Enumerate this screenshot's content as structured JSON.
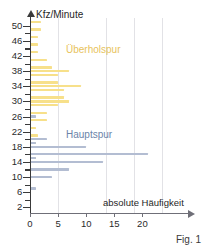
{
  "figure": {
    "caption": "Fig. 1"
  },
  "chart_data": {
    "type": "bar",
    "orientation": "horizontal",
    "title": "",
    "xlabel": "absolute Häufigkeit",
    "ylabel": "Kfz/Minute",
    "xlim": [
      0,
      22
    ],
    "ylim": [
      0,
      52
    ],
    "grid": "vertical",
    "xticks": [
      0,
      5,
      10,
      15,
      20
    ],
    "xtick_labels": [
      "0",
      "5",
      "10",
      "15",
      "20"
    ],
    "yticks": [
      2,
      6,
      10,
      14,
      18,
      22,
      26,
      30,
      34,
      38,
      42,
      46,
      50
    ],
    "ytick_labels": [
      "2",
      "6",
      "10",
      "14",
      "18",
      "22",
      "26",
      "30",
      "34",
      "38",
      "42",
      "46",
      "50"
    ],
    "y_minor_step": 2,
    "legend_position": "inside-plot",
    "colors": {
      "ueberholspur": "#f7e08a",
      "hauptspur": "#b3bdd2",
      "ueberholspur_label": "#e8c35c",
      "hauptspur_label": "#6b84a8",
      "axis": "#3a3a3a",
      "grid": "#e2e2e6"
    },
    "series": [
      {
        "name": "Überholspur",
        "color": "#f7e08a",
        "points": [
          {
            "y": 51,
            "value": 2
          },
          {
            "y": 49,
            "value": 2
          },
          {
            "y": 47,
            "value": 1.5
          },
          {
            "y": 45,
            "value": 1.5
          },
          {
            "y": 43,
            "value": 1.5
          },
          {
            "y": 41,
            "value": 3
          },
          {
            "y": 39,
            "value": 4
          },
          {
            "y": 38,
            "value": 7
          },
          {
            "y": 37,
            "value": 5
          },
          {
            "y": 35,
            "value": 5
          },
          {
            "y": 34,
            "value": 9
          },
          {
            "y": 33,
            "value": 6
          },
          {
            "y": 31,
            "value": 6
          },
          {
            "y": 30,
            "value": 7
          },
          {
            "y": 29,
            "value": 5
          },
          {
            "y": 27,
            "value": 3
          },
          {
            "y": 25,
            "value": 3
          },
          {
            "y": 23,
            "value": 1
          },
          {
            "y": 21,
            "value": 1.5
          },
          {
            "y": 19,
            "value": 1
          },
          {
            "y": 15,
            "value": 1
          }
        ]
      },
      {
        "name": "Hauptspur",
        "color": "#b3bdd2",
        "points": [
          {
            "y": 26,
            "value": 1
          },
          {
            "y": 20,
            "value": 3
          },
          {
            "y": 19,
            "value": 1
          },
          {
            "y": 18,
            "value": 10
          },
          {
            "y": 16,
            "value": 21
          },
          {
            "y": 15,
            "value": 1
          },
          {
            "y": 14,
            "value": 13
          },
          {
            "y": 12,
            "value": 7
          },
          {
            "y": 10,
            "value": 4
          },
          {
            "y": 7,
            "value": 1
          }
        ]
      }
    ],
    "annotations": [
      {
        "text": "Überholspur",
        "x": 5.2,
        "y": 44,
        "color": "#e8c35c"
      },
      {
        "text": "Hauptspur",
        "x": 5.2,
        "y": 21,
        "color": "#6b84a8"
      }
    ]
  }
}
